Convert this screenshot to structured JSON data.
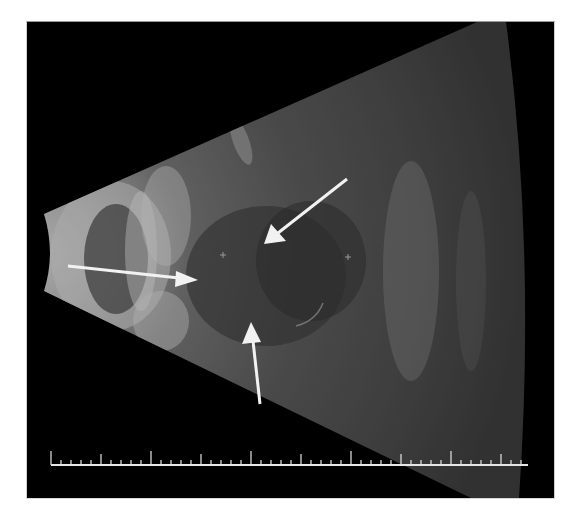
{
  "figure": {
    "background_color": "#ffffff",
    "frame_color": "#000000"
  },
  "scan": {
    "type": "sector B-scan ultrasound",
    "fan_apex_left_x": 43,
    "markers": [
      {
        "name": "caliper-marker-1",
        "x": 222,
        "y": 254,
        "symbol": "+"
      },
      {
        "name": "caliper-marker-2",
        "x": 347,
        "y": 256,
        "symbol": "+"
      }
    ]
  },
  "annotations": {
    "arrows": [
      {
        "name": "arrow-left-horizontal",
        "from": [
          67,
          265
        ],
        "to": [
          197,
          279
        ],
        "color": "#f2f2f2"
      },
      {
        "name": "arrow-upper-right-diagonal",
        "from": [
          346,
          178
        ],
        "to": [
          263,
          243
        ],
        "color": "#f2f2f2"
      },
      {
        "name": "arrow-bottom-vertical",
        "from": [
          259,
          403
        ],
        "to": [
          250,
          321
        ],
        "color": "#f2f2f2"
      }
    ]
  },
  "scale_bar": {
    "x_start": 50,
    "x_end": 527,
    "y": 464,
    "minor_tick_spacing_px": 10,
    "major_tick_every": 5,
    "color": "#e6e6e6"
  }
}
